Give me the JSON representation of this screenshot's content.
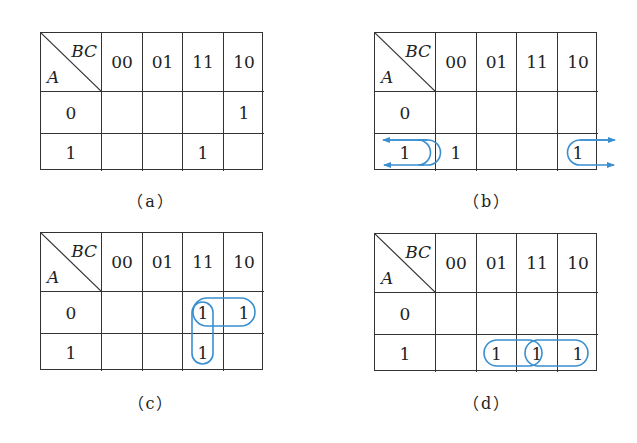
{
  "loop_color": "#3a8fd0",
  "corner": {
    "col_var": "BC",
    "row_var": "A"
  },
  "col_headers": [
    "00",
    "01",
    "11",
    "10"
  ],
  "row_headers": [
    "0",
    "1"
  ],
  "maps": [
    {
      "id": "a",
      "caption": "（a）",
      "cells": [
        [
          "",
          "",
          "",
          "1"
        ],
        [
          "",
          "",
          "1",
          ""
        ]
      ],
      "loops": []
    },
    {
      "id": "b",
      "caption": "（b）",
      "cells": [
        [
          "",
          "",
          "",
          ""
        ],
        [
          "1",
          "",
          "",
          "1"
        ]
      ],
      "loops": [
        {
          "type": "wraparound",
          "row": 1,
          "cols": [
            "00",
            "10"
          ],
          "note": "edge-adjacent grouping with arrows"
        }
      ]
    },
    {
      "id": "c",
      "caption": "（c）",
      "cells": [
        [
          "",
          "",
          "1",
          "1"
        ],
        [
          "",
          "",
          "1",
          ""
        ]
      ],
      "loops": [
        {
          "type": "horizontal",
          "row": 0,
          "cols": [
            "11",
            "10"
          ]
        },
        {
          "type": "vertical",
          "rows": [
            0,
            1
          ],
          "col": "11"
        }
      ]
    },
    {
      "id": "d",
      "caption": "（d）",
      "cells": [
        [
          "",
          "",
          "",
          ""
        ],
        [
          "",
          "1",
          "1",
          "1"
        ]
      ],
      "loops": [
        {
          "type": "horizontal",
          "row": 1,
          "cols": [
            "01",
            "11"
          ]
        },
        {
          "type": "horizontal",
          "row": 1,
          "cols": [
            "11",
            "10"
          ]
        }
      ]
    }
  ]
}
